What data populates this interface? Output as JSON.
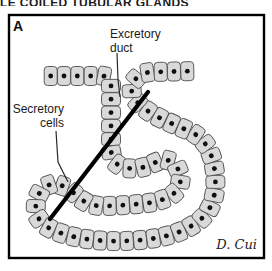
{
  "figure": {
    "clipped_title": "LE COILED TUBULAR GLANDS",
    "panel_label": "A",
    "signature": "D. Cui"
  },
  "labels": {
    "excretory_duct": {
      "line1": "Excretory",
      "line2": "duct"
    },
    "secretory_cells": {
      "line1": "Secretory",
      "line2": "cells"
    }
  },
  "diagram": {
    "approx_cell_count": 57,
    "cell_width_px": 13,
    "cell_height_px": 19,
    "cell_spacing_px": 13.4,
    "colors": {
      "background": "#ffffff",
      "panel_border": "#000000",
      "cell_fill": "#d9d9d9",
      "cell_outline": "#4f4f4f",
      "nucleus": "#101010",
      "section_line": "#000000",
      "pointer_line": "#2a2a2a",
      "label_text": "#1a1a1a"
    }
  }
}
